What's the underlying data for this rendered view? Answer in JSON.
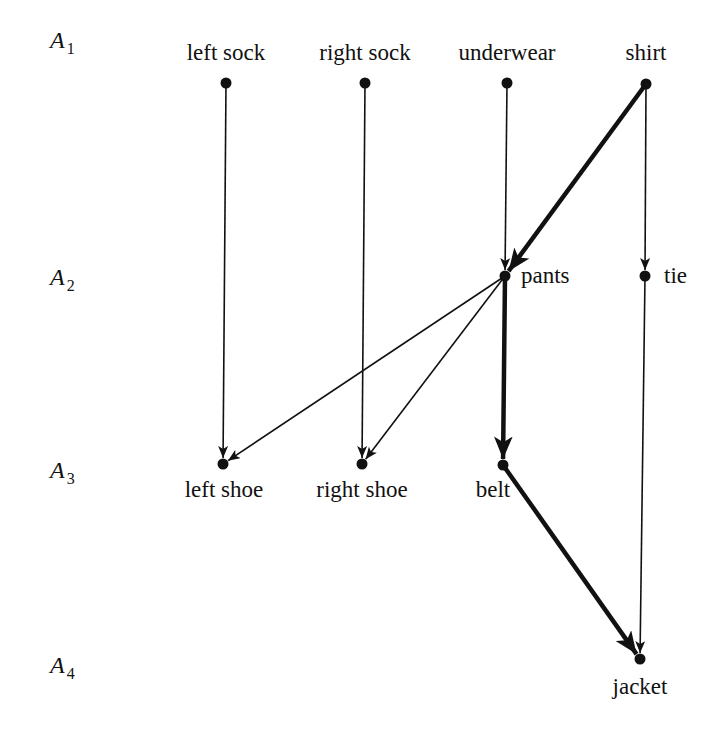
{
  "diagram": {
    "type": "directed-acyclic-graph",
    "levels": [
      {
        "id": "A1",
        "letter": "A",
        "sub": "1",
        "y": 40
      },
      {
        "id": "A2",
        "letter": "A",
        "sub": "2",
        "y": 277
      },
      {
        "id": "A3",
        "letter": "A",
        "sub": "3",
        "y": 470
      },
      {
        "id": "A4",
        "letter": "A",
        "sub": "4",
        "y": 665
      }
    ],
    "nodes": [
      {
        "id": "left_sock",
        "label": "left sock",
        "level": "A1",
        "x": 226,
        "y": 83,
        "label_x": 226,
        "label_y": 60,
        "anchor": "middle"
      },
      {
        "id": "right_sock",
        "label": "right sock",
        "level": "A1",
        "x": 365,
        "y": 83,
        "label_x": 365,
        "label_y": 60,
        "anchor": "middle"
      },
      {
        "id": "underwear",
        "label": "underwear",
        "level": "A1",
        "x": 507,
        "y": 83,
        "label_x": 507,
        "label_y": 60,
        "anchor": "middle"
      },
      {
        "id": "shirt",
        "label": "shirt",
        "level": "A1",
        "x": 646,
        "y": 84,
        "label_x": 646,
        "label_y": 60,
        "anchor": "middle"
      },
      {
        "id": "pants",
        "label": "pants",
        "level": "A2",
        "x": 505,
        "y": 276,
        "label_x": 521,
        "label_y": 283,
        "anchor": "start"
      },
      {
        "id": "tie",
        "label": "tie",
        "level": "A2",
        "x": 645,
        "y": 276,
        "label_x": 664,
        "label_y": 283,
        "anchor": "start"
      },
      {
        "id": "left_shoe",
        "label": "left shoe",
        "level": "A3",
        "x": 223,
        "y": 464,
        "label_x": 224,
        "label_y": 497,
        "anchor": "middle"
      },
      {
        "id": "right_shoe",
        "label": "right shoe",
        "level": "A3",
        "x": 362,
        "y": 464,
        "label_x": 362,
        "label_y": 497,
        "anchor": "middle"
      },
      {
        "id": "belt",
        "label": "belt",
        "level": "A3",
        "x": 503,
        "y": 465,
        "label_x": 493,
        "label_y": 497,
        "anchor": "middle"
      },
      {
        "id": "jacket",
        "label": "jacket",
        "level": "A4",
        "x": 640,
        "y": 659,
        "label_x": 640,
        "label_y": 694,
        "anchor": "middle"
      }
    ],
    "edges": [
      {
        "from": "left_sock",
        "to": "left_shoe",
        "weight": "thin"
      },
      {
        "from": "right_sock",
        "to": "right_shoe",
        "weight": "thin"
      },
      {
        "from": "underwear",
        "to": "pants",
        "weight": "thin"
      },
      {
        "from": "shirt",
        "to": "pants",
        "weight": "thick"
      },
      {
        "from": "shirt",
        "to": "tie",
        "weight": "thin"
      },
      {
        "from": "pants",
        "to": "left_shoe",
        "weight": "thin"
      },
      {
        "from": "pants",
        "to": "right_shoe",
        "weight": "thin"
      },
      {
        "from": "pants",
        "to": "belt",
        "weight": "thick"
      },
      {
        "from": "tie",
        "to": "jacket",
        "weight": "thin"
      },
      {
        "from": "belt",
        "to": "jacket",
        "weight": "thick"
      }
    ],
    "level_label_x": 50,
    "colors": {
      "ink": "#111111",
      "background": "#ffffff"
    }
  }
}
